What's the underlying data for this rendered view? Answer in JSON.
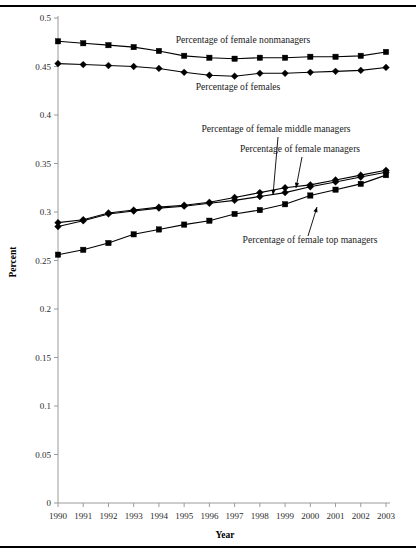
{
  "figure": {
    "name": "female-representation-line-chart",
    "xlabel": "Year",
    "ylabel": "Percent"
  },
  "chart_data": {
    "type": "line",
    "title": "",
    "xlabel": "Year",
    "ylabel": "Percent",
    "xlim": [
      1990,
      2003
    ],
    "ylim": [
      0,
      0.5
    ],
    "ytick_step": 0.05,
    "grid": false,
    "legend": "inline-annotations",
    "x": [
      1990,
      1991,
      1992,
      1993,
      1994,
      1995,
      1996,
      1997,
      1998,
      1999,
      2000,
      2001,
      2002,
      2003
    ],
    "xticklabels": [
      "1990",
      "1991",
      "1992",
      "1993",
      "1994",
      "1995",
      "1996",
      "1997",
      "1998",
      "1999",
      "2000",
      "2001",
      "2002",
      "2003"
    ],
    "yticklabels": [
      "0",
      "0.05",
      "0.1",
      "0.15",
      "0.2",
      "0.25",
      "0.3",
      "0.35",
      "0.4",
      "0.45",
      "0.5"
    ],
    "yticks": [
      0,
      0.05,
      0.1,
      0.15,
      0.2,
      0.25,
      0.3,
      0.35,
      0.4,
      0.45,
      0.5
    ],
    "series": [
      {
        "name": "Percentage of female nonmanagers",
        "marker": "square",
        "values": [
          0.476,
          0.474,
          0.472,
          0.47,
          0.466,
          0.461,
          0.459,
          0.458,
          0.459,
          0.459,
          0.46,
          0.46,
          0.461,
          0.465
        ]
      },
      {
        "name": "Percentage of females",
        "marker": "diamond",
        "values": [
          0.453,
          0.452,
          0.451,
          0.45,
          0.448,
          0.444,
          0.441,
          0.44,
          0.443,
          0.443,
          0.444,
          0.445,
          0.446,
          0.449
        ]
      },
      {
        "name": "Percentage of female middle managers",
        "marker": "diamond",
        "values": [
          0.289,
          0.292,
          0.299,
          0.302,
          0.305,
          0.307,
          0.31,
          0.315,
          0.32,
          0.325,
          0.328,
          0.333,
          0.338,
          0.343
        ]
      },
      {
        "name": "Percentage of female managers",
        "marker": "diamond",
        "values": [
          0.285,
          0.291,
          0.298,
          0.301,
          0.304,
          0.306,
          0.309,
          0.312,
          0.316,
          0.32,
          0.326,
          0.331,
          0.336,
          0.341
        ]
      },
      {
        "name": "Percentage of female top managers",
        "marker": "square",
        "values": [
          0.256,
          0.261,
          0.268,
          0.277,
          0.282,
          0.287,
          0.291,
          0.298,
          0.302,
          0.308,
          0.317,
          0.323,
          0.329,
          0.338
        ]
      }
    ],
    "annotations": [
      {
        "text": "Percentage of female nonmanagers",
        "x": 243,
        "y": 43,
        "anchor": "middle",
        "leader": null
      },
      {
        "text": "Percentage of females",
        "x": 238,
        "y": 90,
        "anchor": "middle",
        "leader": null
      },
      {
        "text": "Percentage of female middle managers",
        "x": 276,
        "y": 132,
        "anchor": "middle",
        "leader": {
          "x1": 278,
          "y1": 137,
          "x2": 273,
          "y2": 195
        }
      },
      {
        "text": "Percentage of female managers",
        "x": 300,
        "y": 152,
        "anchor": "middle",
        "leader": {
          "x1": 302,
          "y1": 157,
          "x2": 296,
          "y2": 188
        }
      },
      {
        "text": "Percentage of female top managers",
        "x": 310,
        "y": 243,
        "anchor": "middle",
        "leader": {
          "x1": 308,
          "y1": 236,
          "x2": 317,
          "y2": 207
        }
      }
    ]
  }
}
